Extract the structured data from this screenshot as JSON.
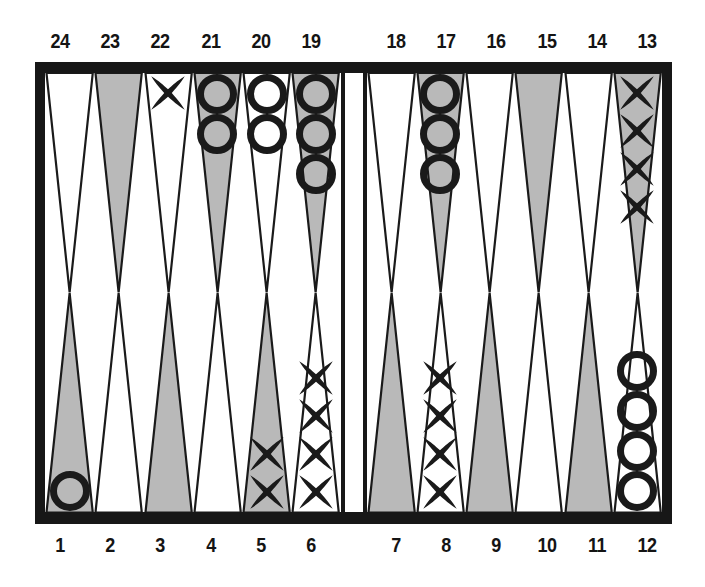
{
  "figure": {
    "kind": "backgammon-board-diagram",
    "colors": {
      "frame": "#171717",
      "point_shaded": "#b9b9b9",
      "point_white": "#ffffff",
      "outline": "#1a1a1a",
      "checker": "#1a1a1a",
      "background": "#ffffff"
    }
  },
  "labels": {
    "top_left": [
      "24",
      "23",
      "22",
      "21",
      "20",
      "19"
    ],
    "top_right": [
      "18",
      "17",
      "16",
      "15",
      "14",
      "13"
    ],
    "bottom_left": [
      "1",
      "2",
      "3",
      "4",
      "5",
      "6"
    ],
    "bottom_right": [
      "7",
      "8",
      "9",
      "10",
      "11",
      "12"
    ]
  },
  "quadrants": {
    "top_left": [
      {
        "point": "24",
        "shade": "white",
        "checker": "none",
        "count": 0
      },
      {
        "point": "23",
        "shade": "shaded",
        "checker": "none",
        "count": 0
      },
      {
        "point": "22",
        "shade": "white",
        "checker": "x",
        "count": 1
      },
      {
        "point": "21",
        "shade": "shaded",
        "checker": "o",
        "count": 2
      },
      {
        "point": "20",
        "shade": "white",
        "checker": "o",
        "count": 2
      },
      {
        "point": "19",
        "shade": "shaded",
        "checker": "o",
        "count": 3
      }
    ],
    "top_right": [
      {
        "point": "18",
        "shade": "white",
        "checker": "none",
        "count": 0
      },
      {
        "point": "17",
        "shade": "shaded",
        "checker": "o",
        "count": 3
      },
      {
        "point": "16",
        "shade": "white",
        "checker": "none",
        "count": 0
      },
      {
        "point": "15",
        "shade": "shaded",
        "checker": "none",
        "count": 0
      },
      {
        "point": "14",
        "shade": "white",
        "checker": "none",
        "count": 0
      },
      {
        "point": "13",
        "shade": "shaded",
        "checker": "x",
        "count": 4
      }
    ],
    "bottom_left": [
      {
        "point": "1",
        "shade": "shaded",
        "checker": "o",
        "count": 1
      },
      {
        "point": "2",
        "shade": "white",
        "checker": "none",
        "count": 0
      },
      {
        "point": "3",
        "shade": "shaded",
        "checker": "none",
        "count": 0
      },
      {
        "point": "4",
        "shade": "white",
        "checker": "none",
        "count": 0
      },
      {
        "point": "5",
        "shade": "shaded",
        "checker": "x",
        "count": 2
      },
      {
        "point": "6",
        "shade": "white",
        "checker": "x",
        "count": 4
      }
    ],
    "bottom_right": [
      {
        "point": "7",
        "shade": "shaded",
        "checker": "none",
        "count": 0
      },
      {
        "point": "8",
        "shade": "white",
        "checker": "x",
        "count": 4
      },
      {
        "point": "9",
        "shade": "shaded",
        "checker": "none",
        "count": 0
      },
      {
        "point": "10",
        "shade": "white",
        "checker": "none",
        "count": 0
      },
      {
        "point": "11",
        "shade": "shaded",
        "checker": "none",
        "count": 0
      },
      {
        "point": "12",
        "shade": "white",
        "checker": "o",
        "count": 4
      }
    ]
  },
  "bar": {
    "x_checkers": 0,
    "o_checkers": 0
  }
}
